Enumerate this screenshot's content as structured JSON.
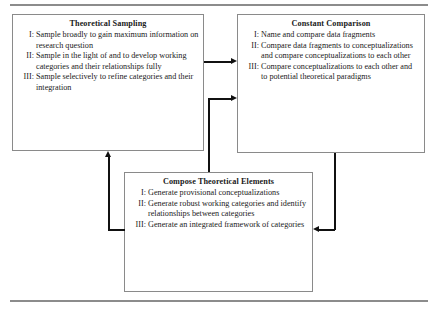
{
  "figure": {
    "boxes": [
      {
        "id": "theoretical-sampling",
        "title": "Theoretical Sampling",
        "items": [
          {
            "numeral": "I:",
            "text": "Sample broadly to gain maximum information on research question"
          },
          {
            "numeral": "II:",
            "text": "Sample in the light of and to develop working categories and their relationships fully"
          },
          {
            "numeral": "III:",
            "text": "Sample selectively to refine categories and their integration"
          }
        ]
      },
      {
        "id": "constant-comparison",
        "title": "Constant Comparison",
        "items": [
          {
            "numeral": "I:",
            "text": "Name and compare data fragments"
          },
          {
            "numeral": "II:",
            "text": "Compare data fragments to conceptualizations and compare conceptualizations to each other"
          },
          {
            "numeral": "III:",
            "text": "Compare conceptualizations to each other and to potential theoretical paradigms"
          }
        ]
      },
      {
        "id": "compose-elements",
        "title": "Compose Theoretical Elements",
        "items": [
          {
            "numeral": "I:",
            "text": "Generate provisional conceptualizations"
          },
          {
            "numeral": "II:",
            "text": "Generate robust working categories and identify relationships between categories"
          },
          {
            "numeral": "III:",
            "text": "Generate an integrated framework of categories"
          }
        ]
      }
    ],
    "connectors": [
      {
        "id": "sampling-to-comparison",
        "from": "theoretical-sampling",
        "to": "constant-comparison",
        "direction": "right"
      },
      {
        "id": "comparison-to-compose",
        "from": "constant-comparison",
        "to": "compose-elements",
        "direction": "left"
      },
      {
        "id": "compose-to-sampling",
        "from": "compose-elements",
        "to": "theoretical-sampling",
        "direction": "up"
      },
      {
        "id": "compose-to-comparison",
        "from": "compose-elements",
        "to": "constant-comparison",
        "direction": "right"
      }
    ],
    "colors": {
      "box_border": "#8a8a8a",
      "rule": "#8c8c8c",
      "connector": "#111111",
      "text": "#1a1a1a",
      "background": "#ffffff"
    }
  }
}
